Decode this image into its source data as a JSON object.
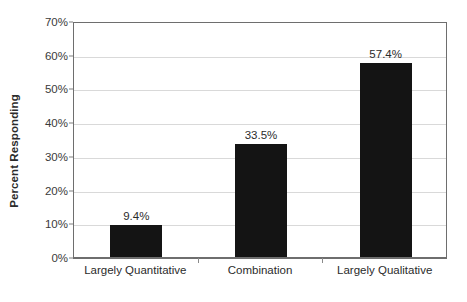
{
  "chart_data": {
    "type": "bar",
    "title": "",
    "subtitle": "",
    "xlabel": "",
    "ylabel": "Percent Responding",
    "categories": [
      "Largely Quantitative",
      "Combination",
      "Largely Qualitative"
    ],
    "values": [
      9.4,
      33.5,
      57.4
    ],
    "value_labels": [
      "9.4%",
      "33.5%",
      "57.4%"
    ],
    "ylim": [
      0,
      70
    ],
    "ytick_values": [
      0,
      10,
      20,
      30,
      40,
      50,
      60,
      70
    ],
    "ytick_labels": [
      "0%",
      "10%",
      "20%",
      "30%",
      "40%",
      "50%",
      "60%",
      "70%"
    ],
    "grid": true,
    "grid_axis": "y",
    "legend": false,
    "legend_position": "none",
    "bar_color": "#141414",
    "gridline_color": "#d9d9d9",
    "axis_color": "#6e6e6e",
    "background_color": "#ffffff",
    "text_color": "#2b2b2b"
  }
}
